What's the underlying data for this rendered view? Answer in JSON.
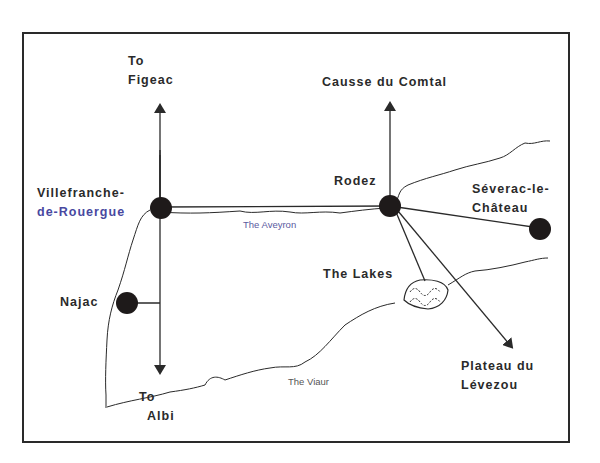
{
  "map": {
    "title": "",
    "places": {
      "villefranche": {
        "line1": "Villefranche-",
        "line2": "de-Rouergue"
      },
      "rodez": {
        "label": "Rodez"
      },
      "severac": {
        "line1": "Séverac-le-",
        "line2": "Château"
      },
      "najac": {
        "label": "Najac"
      },
      "lakes": {
        "label": "The Lakes"
      }
    },
    "directions": {
      "figeac": {
        "line1": "To",
        "line2": "Figeac"
      },
      "causse": {
        "label": "Causse du Comtal"
      },
      "albi": {
        "line1": "To",
        "line2": "Albi"
      },
      "levezou": {
        "line1": "Plateau du",
        "line2": "Lévezou"
      }
    },
    "rivers": {
      "aveyron": "The Aveyron",
      "viaur": "The Viaur"
    },
    "colors": {
      "ink": "#2a2a2a",
      "town_dot": "#1e1a1a",
      "river_label": "#555555",
      "aveyron_label": "#5a5aa0"
    }
  }
}
